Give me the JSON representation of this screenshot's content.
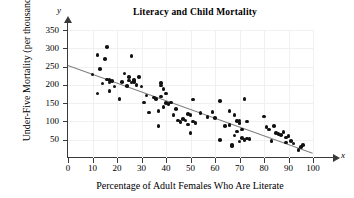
{
  "chart_data": {
    "type": "scatter",
    "title": "Literacy and Child Mortality",
    "xlabel": "Percentage of Adult Females Who Are Literate",
    "ylabel": "Under-Five Mortality (per thousand)",
    "x_axis_symbol": "x",
    "y_axis_symbol": "y",
    "xlim": [
      0,
      100
    ],
    "ylim": [
      0,
      360
    ],
    "xticks": [
      0,
      10,
      20,
      30,
      40,
      50,
      60,
      70,
      80,
      90,
      100
    ],
    "yticks": [
      50,
      100,
      150,
      200,
      250,
      300,
      350
    ],
    "grid": true,
    "legend": "none",
    "point_color": "#111111",
    "trendline": {
      "color": "#808080",
      "x_start": 0,
      "y_start": 255,
      "x_end": 100,
      "y_end": 15,
      "slope": -2.4,
      "intercept": 255
    },
    "points": [
      [
        10,
        228
      ],
      [
        12,
        281
      ],
      [
        12,
        176
      ],
      [
        13,
        243
      ],
      [
        14,
        204
      ],
      [
        15,
        270
      ],
      [
        16,
        303
      ],
      [
        16,
        215
      ],
      [
        17,
        213
      ],
      [
        17,
        207
      ],
      [
        17,
        183
      ],
      [
        18,
        210
      ],
      [
        19,
        196
      ],
      [
        21,
        162
      ],
      [
        22,
        208
      ],
      [
        23,
        231
      ],
      [
        24,
        197
      ],
      [
        25,
        221
      ],
      [
        25,
        212
      ],
      [
        26,
        279
      ],
      [
        26,
        206
      ],
      [
        27,
        214
      ],
      [
        27,
        208
      ],
      [
        28,
        199
      ],
      [
        29,
        222
      ],
      [
        30,
        196
      ],
      [
        31,
        152
      ],
      [
        32,
        171
      ],
      [
        33,
        124
      ],
      [
        35,
        165
      ],
      [
        36,
        161
      ],
      [
        37,
        128
      ],
      [
        37,
        88
      ],
      [
        38,
        205
      ],
      [
        38,
        198
      ],
      [
        38,
        168
      ],
      [
        39,
        140
      ],
      [
        39,
        189
      ],
      [
        40,
        176
      ],
      [
        40,
        150
      ],
      [
        41,
        148
      ],
      [
        42,
        152
      ],
      [
        43,
        118
      ],
      [
        44,
        134
      ],
      [
        45,
        103
      ],
      [
        46,
        98
      ],
      [
        47,
        106
      ],
      [
        48,
        103
      ],
      [
        49,
        92
      ],
      [
        49,
        121
      ],
      [
        50,
        118
      ],
      [
        50,
        68
      ],
      [
        51,
        160
      ],
      [
        51,
        100
      ],
      [
        52,
        96
      ],
      [
        54,
        123
      ],
      [
        57,
        112
      ],
      [
        59,
        126
      ],
      [
        60,
        110
      ],
      [
        62,
        156
      ],
      [
        62,
        49
      ],
      [
        64,
        88
      ],
      [
        66,
        128
      ],
      [
        66,
        90
      ],
      [
        67,
        33
      ],
      [
        67,
        36
      ],
      [
        68,
        118
      ],
      [
        68,
        62
      ],
      [
        69,
        101
      ],
      [
        69,
        72
      ],
      [
        70,
        96
      ],
      [
        70,
        45
      ],
      [
        70,
        103
      ],
      [
        71,
        78
      ],
      [
        71,
        55
      ],
      [
        72,
        161
      ],
      [
        72,
        50
      ],
      [
        73,
        100
      ],
      [
        73,
        53
      ],
      [
        74,
        52
      ],
      [
        80,
        113
      ],
      [
        81,
        84
      ],
      [
        82,
        78
      ],
      [
        83,
        46
      ],
      [
        84,
        87
      ],
      [
        85,
        69
      ],
      [
        86,
        66
      ],
      [
        87,
        63
      ],
      [
        88,
        71
      ],
      [
        89,
        56
      ],
      [
        89,
        42
      ],
      [
        90,
        60
      ],
      [
        91,
        46
      ],
      [
        92,
        40
      ],
      [
        94,
        22
      ],
      [
        95,
        30
      ],
      [
        96,
        36
      ]
    ]
  }
}
